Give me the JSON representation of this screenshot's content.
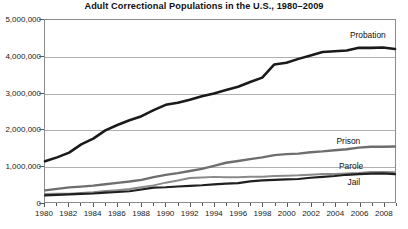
{
  "chart_data": {
    "type": "line",
    "title": "Adult Correctional Populations in the U.S., 1980–2009",
    "xlabel": "",
    "ylabel": "",
    "xlim": [
      1980,
      2009
    ],
    "ylim": [
      0,
      5000000
    ],
    "grid": true,
    "legend_position": "right-inline",
    "x": [
      1980,
      1981,
      1982,
      1983,
      1984,
      1985,
      1986,
      1987,
      1988,
      1989,
      1990,
      1991,
      1992,
      1993,
      1994,
      1995,
      1996,
      1997,
      1998,
      1999,
      2000,
      2001,
      2002,
      2003,
      2004,
      2005,
      2006,
      2007,
      2008,
      2009
    ],
    "x_tick_labels": [
      "1980",
      "1982",
      "1984",
      "1986",
      "1988",
      "1990",
      "1992",
      "1994",
      "1996",
      "1998",
      "2000",
      "2002",
      "2004",
      "2006",
      "2008"
    ],
    "x_tick_values": [
      1980,
      1982,
      1984,
      1986,
      1988,
      1990,
      1992,
      1994,
      1996,
      1998,
      2000,
      2002,
      2004,
      2006,
      2008
    ],
    "y_tick_labels": [
      "0",
      "1,000,000",
      "2,000,000",
      "3,000,000",
      "4,000,000",
      "5,000,000"
    ],
    "y_tick_values": [
      0,
      1000000,
      2000000,
      3000000,
      4000000,
      5000000
    ],
    "series": [
      {
        "name": "Probation",
        "color": "#1a1a1a",
        "width": 2.6,
        "label_x": 2005.2,
        "label_y": 4560000,
        "values": [
          1118097,
          1225934,
          1357264,
          1582947,
          1740948,
          1968712,
          2114621,
          2247158,
          2356483,
          2522125,
          2670234,
          2728472,
          2811611,
          2903061,
          2981022,
          3077861,
          3164996,
          3296513,
          3417613,
          3779922,
          3826209,
          3931731,
          4024067,
          4120012,
          4143792,
          4162536,
          4236800,
          4234471,
          4244046,
          4203967
        ]
      },
      {
        "name": "Prison",
        "color": "#6e6e6e",
        "width": 2.4,
        "label_x": 2004.1,
        "label_y": 1680000,
        "values": [
          319598,
          360029,
          402914,
          423898,
          448264,
          487593,
          526436,
          562814,
          607766,
          683367,
          743382,
          792535,
          850566,
          909381,
          990147,
          1078542,
          1127528,
          1176564,
          1224469,
          1287172,
          1316333,
          1330007,
          1367547,
          1390279,
          1421345,
          1448344,
          1492973,
          1517867,
          1518559,
          1524513
        ]
      },
      {
        "name": "Parole",
        "color": "#8a8a8a",
        "width": 2.0,
        "label_x": 2004.3,
        "label_y": 1010000,
        "values": [
          220438,
          225539,
          224604,
          246440,
          266992,
          300203,
          325638,
          355505,
          407977,
          456803,
          531407,
          590442,
          658601,
          676100,
          690371,
          679421,
          679733,
          694787,
          696385,
          714457,
          723898,
          732333,
          750934,
          769925,
          771852,
          784408,
          798202,
          826097,
          826092,
          819308
        ]
      },
      {
        "name": "Jail",
        "color": "#1f1f1f",
        "width": 2.2,
        "label_x": 2005.0,
        "label_y": 570000,
        "values": [
          182288,
          195085,
          209582,
          223551,
          234500,
          256615,
          274444,
          295873,
          343569,
          395553,
          405320,
          426479,
          444584,
          459804,
          486474,
          507044,
          518492,
          567079,
          592462,
          605943,
          621149,
          631240,
          665475,
          691301,
          713990,
          747529,
          765819,
          780174,
          785533,
          767434
        ]
      }
    ]
  }
}
